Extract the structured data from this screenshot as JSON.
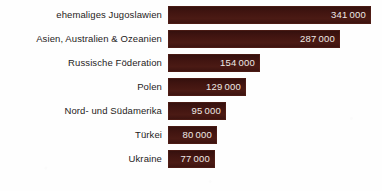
{
  "chart_data": {
    "type": "bar",
    "orientation": "horizontal",
    "title": "",
    "subtitle": "",
    "xlabel": "",
    "ylabel": "",
    "grid": false,
    "legend": false,
    "axis_visible": false,
    "xlim": [
      0,
      341000
    ],
    "categories": [
      "ehemaliges Jugoslawien",
      "Asien, Australien & Ozeanien",
      "Russische Föderation",
      "Polen",
      "Nord- und Südamerika",
      "Türkei",
      "Ukraine"
    ],
    "values": [
      341000,
      287000,
      154000,
      129000,
      95000,
      80000,
      77000
    ],
    "value_labels": [
      "341 000",
      "287 000",
      "154 000",
      "129 000",
      "95 000",
      "80 000",
      "77 000"
    ],
    "bar_color": "#401410",
    "value_text_color": "#efe9e6",
    "category_text_color": "#1e1c1b",
    "background_color": "#fefefe"
  },
  "rows": [
    {
      "label": "ehemaliges Jugoslawien",
      "value_label": "341 000",
      "width_px": 203
    },
    {
      "label": "Asien, Australien & Ozeanien",
      "value_label": "287 000",
      "width_px": 172
    },
    {
      "label": "Russische Föderation",
      "value_label": "154 000",
      "width_px": 92
    },
    {
      "label": "Polen",
      "value_label": "129 000",
      "width_px": 78
    },
    {
      "label": "Nord- und Südamerika",
      "value_label": "95 000",
      "width_px": 58
    },
    {
      "label": "Türkei",
      "value_label": "80 000",
      "width_px": 49
    },
    {
      "label": "Ukraine",
      "value_label": "77 000",
      "width_px": 47
    }
  ]
}
